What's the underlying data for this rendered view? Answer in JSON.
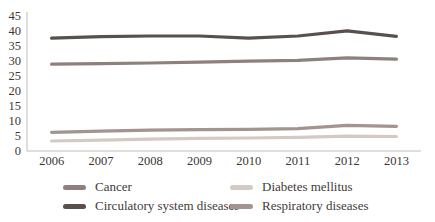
{
  "chart_data": {
    "type": "line",
    "title": "",
    "xlabel": "",
    "ylabel": "",
    "categories": [
      "2006",
      "2007",
      "2008",
      "2009",
      "2010",
      "2011",
      "2012",
      "2013"
    ],
    "series": [
      {
        "name": "Cancer",
        "color": "#8e807d",
        "values": [
          28.6,
          28.8,
          29.0,
          29.3,
          29.6,
          29.9,
          30.7,
          30.3
        ]
      },
      {
        "name": "Diabetes mellitus",
        "color": "#d4c9c5",
        "values": [
          3.0,
          3.3,
          3.6,
          3.9,
          4.0,
          4.2,
          4.6,
          4.5
        ]
      },
      {
        "name": "Circulatory system diseases",
        "color": "#57504d",
        "values": [
          37.3,
          37.8,
          38.0,
          38.0,
          37.3,
          38.0,
          39.7,
          37.9
        ]
      },
      {
        "name": "Respiratory diseases",
        "color": "#a39490",
        "values": [
          5.9,
          6.3,
          6.6,
          6.8,
          6.9,
          7.1,
          8.2,
          7.9
        ]
      }
    ],
    "ylim": [
      0,
      45
    ],
    "ytick_step": 5,
    "yticks": [
      0,
      5,
      10,
      15,
      20,
      25,
      30,
      35,
      40,
      45
    ],
    "grid": false,
    "legend_position": "bottom"
  },
  "style": {
    "axis_color": "#c1beba",
    "tick_text_color": "#3a3733",
    "line_width": 3.2
  }
}
